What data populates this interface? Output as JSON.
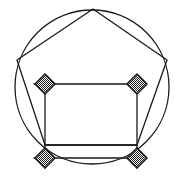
{
  "diagram": {
    "colors": {
      "stroke": "#1a1a1a",
      "background": "#ffffff",
      "fill_hatch": "#2a2a2a"
    },
    "circle": {
      "cx": 92,
      "cy": 87,
      "r": 77
    },
    "pentagon": {
      "vertices": [
        [
          93,
          9
        ],
        [
          167,
          60
        ],
        [
          137,
          145
        ],
        [
          45,
          145
        ],
        [
          17,
          60
        ]
      ]
    },
    "rectangle": {
      "x1": 45,
      "y1": 84,
      "x2": 137,
      "y2": 145
    },
    "bottom_line": {
      "x1": 34,
      "y1": 158,
      "x2": 137,
      "y2": 158
    },
    "top_tick": {
      "x1": 34,
      "y1": 84,
      "x2": 45,
      "y2": 84
    },
    "diamonds": [
      {
        "name": "diamond-top-left",
        "cx": 45,
        "cy": 84,
        "size": 10
      },
      {
        "name": "diamond-top-right",
        "cx": 137,
        "cy": 84,
        "size": 10
      },
      {
        "name": "diamond-bottom-left",
        "cx": 45,
        "cy": 158,
        "size": 10
      },
      {
        "name": "diamond-bottom-right",
        "cx": 137,
        "cy": 158,
        "size": 10
      }
    ]
  }
}
